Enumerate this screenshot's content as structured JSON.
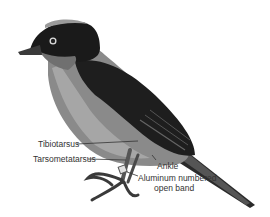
{
  "diagram": {
    "labels": [
      {
        "id": "tibiotarsus",
        "text": "Tibiotarsus"
      },
      {
        "id": "tarsometatarsus",
        "text": "Tarsometatarsus"
      },
      {
        "id": "ankle",
        "text": "Ankle"
      },
      {
        "id": "band_line1",
        "text": "Aluminum numbered"
      },
      {
        "id": "band_line2",
        "text": "open band"
      }
    ]
  }
}
